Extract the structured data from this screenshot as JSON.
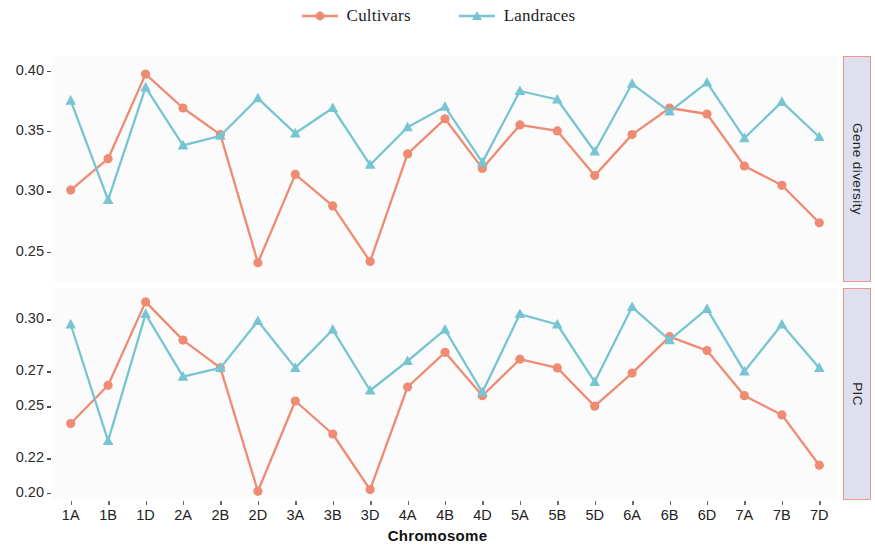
{
  "legend": {
    "position": "top",
    "items": [
      {
        "label": "Cultivars",
        "color": "#ef8b72",
        "marker": "circle",
        "key_name": "legend-key-cultivars"
      },
      {
        "label": "Landraces",
        "color": "#77c5d2",
        "marker": "triangle",
        "key_name": "legend-key-landraces"
      }
    ]
  },
  "axis": {
    "x_title": "Chromosome"
  },
  "facets": [
    {
      "label": "Gene diversity",
      "name": "facet-strip-gene-diversity"
    },
    {
      "label": "PIC",
      "name": "facet-strip-pic"
    }
  ],
  "colors": {
    "cultivars": "#ef8b72",
    "landraces": "#77c5d2",
    "panel_background": "#fbfbfc",
    "strip_background": "#dfe0ef",
    "strip_border": "#e79a8c",
    "tick_text": "#2b2b2b"
  },
  "chart_data": [
    {
      "type": "line",
      "title": "Gene diversity",
      "panel": "top",
      "xlabel": "Chromosome",
      "ylabel": "Gene diversity",
      "categories": [
        "1A",
        "1B",
        "1D",
        "2A",
        "2B",
        "2D",
        "3A",
        "3B",
        "3D",
        "4A",
        "4B",
        "4D",
        "5A",
        "5B",
        "5D",
        "6A",
        "6B",
        "6D",
        "7A",
        "7B",
        "7D"
      ],
      "yticks": [
        0.25,
        0.3,
        0.35,
        0.4
      ],
      "ytick_labels": [
        "0.25",
        "0.30",
        "0.35",
        "0.40"
      ],
      "ylim": [
        0.225,
        0.412
      ],
      "grid": false,
      "legend_position": "top",
      "series": [
        {
          "name": "Cultivars",
          "color": "#ef8b72",
          "marker": "circle",
          "values": [
            0.301,
            0.327,
            0.397,
            0.369,
            0.347,
            0.241,
            0.314,
            0.288,
            0.242,
            0.331,
            0.36,
            0.319,
            0.355,
            0.35,
            0.313,
            0.347,
            0.369,
            0.364,
            0.321,
            0.305,
            0.274
          ]
        },
        {
          "name": "Landraces",
          "color": "#77c5d2",
          "marker": "triangle",
          "values": [
            0.375,
            0.293,
            0.386,
            0.338,
            0.346,
            0.377,
            0.348,
            0.369,
            0.322,
            0.353,
            0.37,
            0.324,
            0.383,
            0.376,
            0.333,
            0.389,
            0.366,
            0.39,
            0.344,
            0.374,
            0.345
          ]
        }
      ]
    },
    {
      "type": "line",
      "title": "PIC",
      "panel": "bottom",
      "xlabel": "Chromosome",
      "ylabel": "PIC",
      "categories": [
        "1A",
        "1B",
        "1D",
        "2A",
        "2B",
        "2D",
        "3A",
        "3B",
        "3D",
        "4A",
        "4B",
        "4D",
        "5A",
        "5B",
        "5D",
        "6A",
        "6B",
        "6D",
        "7A",
        "7B",
        "7D"
      ],
      "yticks": [
        0.2,
        0.22,
        0.25,
        0.27,
        0.3
      ],
      "ytick_labels": [
        "0.20",
        "0.22",
        "0.25",
        "0.27",
        "0.30"
      ],
      "ylim": [
        0.196,
        0.318
      ],
      "grid": false,
      "legend_position": "top",
      "series": [
        {
          "name": "Cultivars",
          "color": "#ef8b72",
          "marker": "circle",
          "values": [
            0.24,
            0.262,
            0.31,
            0.288,
            0.272,
            0.201,
            0.253,
            0.234,
            0.202,
            0.261,
            0.281,
            0.256,
            0.277,
            0.272,
            0.25,
            0.269,
            0.29,
            0.282,
            0.256,
            0.245,
            0.216
          ]
        },
        {
          "name": "Landraces",
          "color": "#77c5d2",
          "marker": "triangle",
          "values": [
            0.297,
            0.23,
            0.303,
            0.267,
            0.272,
            0.299,
            0.272,
            0.294,
            0.259,
            0.276,
            0.294,
            0.258,
            0.303,
            0.297,
            0.264,
            0.307,
            0.288,
            0.306,
            0.27,
            0.297,
            0.272
          ]
        }
      ]
    }
  ]
}
